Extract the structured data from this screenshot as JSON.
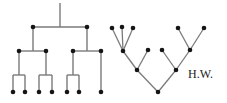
{
  "figure": {
    "background_color": "#ffffff",
    "stroke_color": "#7a7a7a",
    "node_color": "#151515",
    "signature": "H.W.",
    "signature_color": "#1a1a1a"
  },
  "left_tree": {
    "name": "orthogonal-binary-tree",
    "style": "orthogonal",
    "node_radius": 2.3,
    "stem": {
      "x": 60,
      "y_top": 3,
      "y_bottom": 27
    },
    "nodes": [
      {
        "id": "L-a",
        "x": 33,
        "y": 27
      },
      {
        "id": "L-b",
        "x": 87,
        "y": 27
      },
      {
        "id": "L-c",
        "x": 19,
        "y": 51
      },
      {
        "id": "L-d",
        "x": 46,
        "y": 51
      },
      {
        "id": "L-e",
        "x": 73,
        "y": 51
      },
      {
        "id": "L-f",
        "x": 101,
        "y": 51
      },
      {
        "id": "L-g",
        "x": 13,
        "y": 92
      },
      {
        "id": "L-h",
        "x": 25,
        "y": 92
      },
      {
        "id": "L-i",
        "x": 39,
        "y": 92
      },
      {
        "id": "L-j",
        "x": 52,
        "y": 92
      },
      {
        "id": "L-k",
        "x": 67,
        "y": 92
      },
      {
        "id": "L-l",
        "x": 79,
        "y": 92
      },
      {
        "id": "L-m",
        "x": 101,
        "y": 92
      }
    ],
    "edges": [
      {
        "type": "h",
        "x1": 33,
        "x2": 87,
        "y": 27
      },
      {
        "type": "v",
        "x": 33,
        "y1": 27,
        "y2": 51
      },
      {
        "type": "v",
        "x": 87,
        "y1": 27,
        "y2": 51
      },
      {
        "type": "h",
        "x1": 19,
        "x2": 46,
        "y": 51
      },
      {
        "type": "h",
        "x1": 73,
        "x2": 101,
        "y": 51
      },
      {
        "type": "v",
        "x": 19,
        "y1": 51,
        "y2": 75
      },
      {
        "type": "v",
        "x": 46,
        "y1": 51,
        "y2": 75
      },
      {
        "type": "v",
        "x": 73,
        "y1": 51,
        "y2": 75
      },
      {
        "type": "v",
        "x": 101,
        "y1": 51,
        "y2": 92
      },
      {
        "type": "h",
        "x1": 13,
        "x2": 25,
        "y": 75
      },
      {
        "type": "h",
        "x1": 39,
        "x2": 52,
        "y": 75
      },
      {
        "type": "h",
        "x1": 67,
        "x2": 79,
        "y": 75
      },
      {
        "type": "v",
        "x": 13,
        "y1": 75,
        "y2": 92
      },
      {
        "type": "v",
        "x": 25,
        "y1": 75,
        "y2": 92
      },
      {
        "type": "v",
        "x": 39,
        "y1": 75,
        "y2": 92
      },
      {
        "type": "v",
        "x": 52,
        "y1": 75,
        "y2": 92
      },
      {
        "type": "v",
        "x": 67,
        "y1": 75,
        "y2": 92
      },
      {
        "type": "v",
        "x": 79,
        "y1": 75,
        "y2": 92
      }
    ]
  },
  "right_tree": {
    "name": "organic-branching-tree",
    "style": "straight-line",
    "node_radius": 2.3,
    "nodes": [
      {
        "id": "R-root",
        "x": 158,
        "y": 92
      },
      {
        "id": "R-l1",
        "x": 137,
        "y": 70
      },
      {
        "id": "R-r1",
        "x": 176,
        "y": 70
      },
      {
        "id": "R-l2",
        "x": 123,
        "y": 51
      },
      {
        "id": "R-l3",
        "x": 148,
        "y": 50
      },
      {
        "id": "R-r2",
        "x": 162,
        "y": 50
      },
      {
        "id": "R-r3",
        "x": 190,
        "y": 50
      },
      {
        "id": "R-t1",
        "x": 112,
        "y": 28
      },
      {
        "id": "R-t2",
        "x": 122,
        "y": 27
      },
      {
        "id": "R-t3",
        "x": 133,
        "y": 28
      },
      {
        "id": "R-t4",
        "x": 178,
        "y": 28
      },
      {
        "id": "R-t5",
        "x": 204,
        "y": 28
      }
    ],
    "edges": [
      {
        "from": "R-root",
        "to": "R-l1"
      },
      {
        "from": "R-root",
        "to": "R-r1"
      },
      {
        "from": "R-l1",
        "to": "R-l2"
      },
      {
        "from": "R-l1",
        "to": "R-l3"
      },
      {
        "from": "R-r1",
        "to": "R-r2"
      },
      {
        "from": "R-r1",
        "to": "R-r3"
      },
      {
        "from": "R-l2",
        "to": "R-t1"
      },
      {
        "from": "R-l2",
        "to": "R-t2"
      },
      {
        "from": "R-l2",
        "to": "R-t3"
      },
      {
        "from": "R-r3",
        "to": "R-t4"
      },
      {
        "from": "R-r3",
        "to": "R-t5"
      }
    ]
  }
}
